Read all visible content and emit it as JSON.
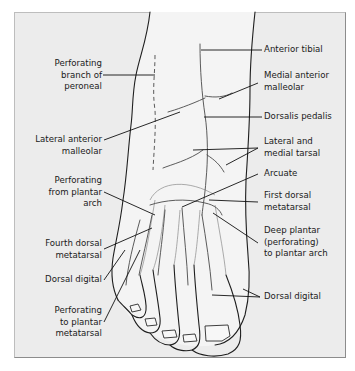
{
  "figure": {
    "labels_left": [
      {
        "id": "perforating-branch-of-peroneal",
        "text": "Perforating\nbranch of\nperoneal"
      },
      {
        "id": "lateral-anterior-malleolar",
        "text": "Lateral anterior\nmalleolar"
      },
      {
        "id": "perforating-from-plantar-arch",
        "text": "Perforating\nfrom plantar\narch"
      },
      {
        "id": "fourth-dorsal-metatarsal",
        "text": "Fourth dorsal\nmetatarsal"
      },
      {
        "id": "dorsal-digital-left",
        "text": "Dorsal digital"
      },
      {
        "id": "perforating-to-plantar-metatarsal",
        "text": "Perforating\nto plantar\nmetatarsal"
      }
    ],
    "labels_right": [
      {
        "id": "anterior-tibial",
        "text": "Anterior tibial"
      },
      {
        "id": "medial-anterior-malleolar",
        "text": "Medial anterior\nmalleolar"
      },
      {
        "id": "dorsalis-pedalis",
        "text": "Dorsalis pedalis"
      },
      {
        "id": "lateral-and-medial-tarsal",
        "text": "Lateral and\nmedial tarsal"
      },
      {
        "id": "arcuate",
        "text": "Arcuate"
      },
      {
        "id": "first-dorsal-metatarsal",
        "text": "First dorsal\nmetatarsal"
      },
      {
        "id": "deep-plantar",
        "text": "Deep plantar\n(perforating)\nto plantar arch"
      },
      {
        "id": "dorsal-digital-right",
        "text": "Dorsal digital"
      }
    ]
  }
}
